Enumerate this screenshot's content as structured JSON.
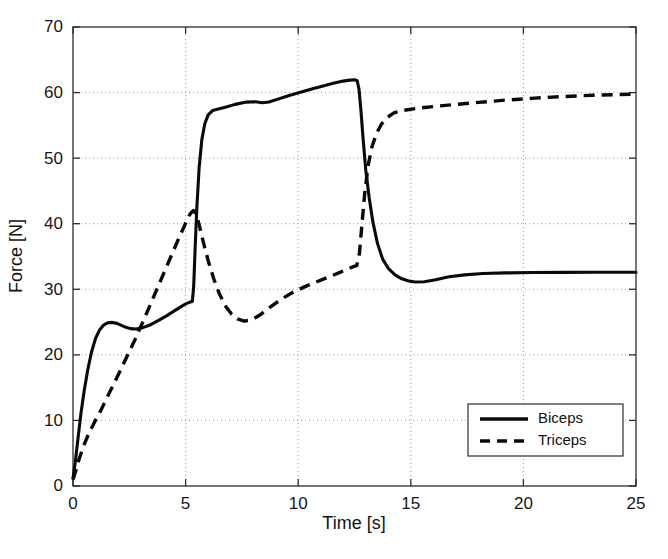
{
  "chart_data": {
    "type": "line",
    "title": "",
    "xlabel": "Time [s]",
    "ylabel": "Force [N]",
    "xlim": [
      0,
      25
    ],
    "ylim": [
      0,
      70
    ],
    "xticks": [
      0,
      5,
      10,
      15,
      20,
      25
    ],
    "yticks": [
      0,
      10,
      20,
      30,
      40,
      50,
      60,
      70
    ],
    "xtick_labels": [
      "0",
      "5",
      "10",
      "15",
      "20",
      "25"
    ],
    "ytick_labels": [
      "0",
      "10",
      "20",
      "30",
      "40",
      "50",
      "60",
      "70"
    ],
    "grid": true,
    "grid_style": "dotted",
    "legend_position": "lower-right",
    "background_color": "#ffffff",
    "line_color": "#0a0a0a",
    "series": [
      {
        "name": "Biceps",
        "style": "solid",
        "x": [
          0.0,
          0.1,
          0.22,
          0.35,
          0.5,
          0.66,
          0.82,
          1.0,
          1.18,
          1.36,
          1.55,
          1.75,
          1.95,
          2.15,
          2.35,
          2.55,
          2.8,
          3.1,
          3.45,
          3.8,
          4.15,
          4.5,
          4.8,
          5.05,
          5.2,
          5.3,
          5.36,
          5.42,
          5.5,
          5.6,
          5.72,
          5.85,
          6.0,
          6.2,
          6.45,
          6.8,
          7.2,
          7.7,
          8.1,
          8.4,
          8.7,
          9.1,
          9.6,
          10.1,
          10.6,
          11.1,
          11.6,
          12.0,
          12.3,
          12.5,
          12.62,
          12.7,
          12.78,
          12.88,
          13.0,
          13.15,
          13.32,
          13.52,
          13.75,
          14.0,
          14.3,
          14.6,
          14.9,
          15.2,
          15.6,
          16.1,
          16.7,
          17.4,
          18.2,
          19.2,
          20.4,
          21.8,
          23.2,
          24.4,
          25.0
        ],
        "y": [
          1.2,
          3.6,
          7.2,
          11.0,
          14.6,
          17.8,
          20.4,
          22.5,
          23.8,
          24.55,
          24.9,
          24.95,
          24.8,
          24.5,
          24.2,
          24.0,
          23.95,
          24.15,
          24.6,
          25.25,
          25.95,
          26.7,
          27.35,
          27.85,
          28.05,
          28.15,
          30.5,
          36.0,
          42.5,
          48.5,
          52.8,
          55.2,
          56.6,
          57.25,
          57.5,
          57.8,
          58.2,
          58.55,
          58.6,
          58.45,
          58.55,
          59.0,
          59.55,
          60.05,
          60.55,
          61.0,
          61.45,
          61.75,
          61.9,
          61.95,
          61.8,
          60.5,
          57.5,
          53.0,
          48.2,
          44.0,
          40.2,
          37.0,
          34.6,
          33.2,
          32.2,
          31.6,
          31.25,
          31.1,
          31.15,
          31.45,
          31.9,
          32.2,
          32.4,
          32.5,
          32.55,
          32.58,
          32.6,
          32.6,
          32.6
        ]
      },
      {
        "name": "Triceps",
        "style": "dashed",
        "x": [
          0.0,
          0.12,
          0.28,
          0.48,
          0.7,
          0.95,
          1.2,
          1.5,
          1.8,
          2.1,
          2.4,
          2.75,
          3.1,
          3.45,
          3.8,
          4.15,
          4.45,
          4.7,
          4.9,
          5.05,
          5.15,
          5.25,
          5.35,
          5.48,
          5.62,
          5.8,
          6.0,
          6.25,
          6.5,
          6.8,
          7.05,
          7.3,
          7.6,
          7.95,
          8.35,
          8.8,
          9.3,
          9.8,
          10.3,
          10.8,
          11.3,
          11.8,
          12.2,
          12.45,
          12.6,
          12.72,
          12.82,
          12.95,
          13.1,
          13.28,
          13.48,
          13.7,
          13.95,
          14.25,
          14.7,
          15.3,
          16.1,
          17.0,
          18.0,
          19.2,
          20.5,
          21.8,
          23.1,
          24.2,
          25.0
        ],
        "y": [
          1.0,
          2.3,
          4.2,
          6.2,
          8.0,
          9.7,
          11.3,
          13.4,
          15.5,
          17.6,
          19.8,
          22.3,
          25.0,
          27.8,
          30.6,
          33.4,
          35.8,
          37.8,
          39.3,
          40.5,
          41.2,
          41.7,
          42.0,
          41.4,
          39.6,
          37.0,
          34.4,
          31.6,
          29.3,
          27.3,
          26.2,
          25.5,
          25.15,
          25.35,
          26.2,
          27.4,
          28.6,
          29.6,
          30.4,
          31.1,
          31.8,
          32.5,
          33.1,
          33.45,
          33.6,
          35.5,
          39.5,
          44.5,
          48.8,
          51.8,
          53.8,
          55.2,
          56.2,
          56.9,
          57.3,
          57.6,
          57.9,
          58.2,
          58.5,
          58.85,
          59.15,
          59.4,
          59.6,
          59.7,
          59.75
        ]
      }
    ],
    "legend": [
      {
        "label": "Biceps",
        "style": "solid"
      },
      {
        "label": "Triceps",
        "style": "dashed"
      }
    ]
  }
}
